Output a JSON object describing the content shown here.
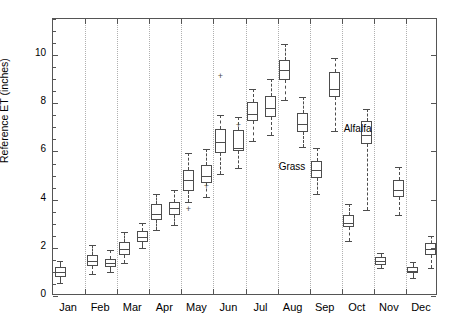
{
  "chart_data": {
    "type": "box",
    "title": "",
    "xlabel": "",
    "ylabel": "Reference ET (inches)",
    "ylim": [
      0,
      11.5
    ],
    "yticks": [
      0,
      2,
      4,
      6,
      8,
      10
    ],
    "ytick_labels": [
      "0",
      "2",
      "4",
      "6",
      "8",
      "10"
    ],
    "grid": "vertical-dotted",
    "categories": [
      "Jan",
      "Feb",
      "Mar",
      "Apr",
      "May",
      "Jun",
      "Jul",
      "Aug",
      "Sep",
      "Oct",
      "Nov",
      "Dec"
    ],
    "annotations": [
      {
        "text": "Alfalfa",
        "x_month": "Sep",
        "y": 6.9
      },
      {
        "text": "Grass",
        "x_month": "Sep",
        "y": 5.3
      }
    ],
    "series": [
      {
        "name": "Grass",
        "boxes": [
          {
            "category": "Jan",
            "whisker_low": 0.55,
            "q1": 0.8,
            "median": 1.0,
            "q3": 1.2,
            "whisker_high": 1.45,
            "outliers": []
          },
          {
            "category": "Feb",
            "whisker_low": 0.9,
            "q1": 1.25,
            "median": 1.45,
            "q3": 1.7,
            "whisker_high": 2.1,
            "outliers": []
          },
          {
            "category": "Mar",
            "whisker_low": 1.35,
            "q1": 1.7,
            "median": 1.95,
            "q3": 2.25,
            "whisker_high": 2.65,
            "outliers": []
          },
          {
            "category": "Apr",
            "whisker_low": 2.75,
            "q1": 3.15,
            "median": 3.4,
            "q3": 3.8,
            "whisker_high": 4.25,
            "outliers": []
          },
          {
            "category": "May",
            "whisker_low": 3.9,
            "q1": 4.35,
            "median": 4.8,
            "q3": 5.25,
            "whisker_high": 5.95,
            "outliers": [
              3.6
            ]
          },
          {
            "category": "Jun",
            "whisker_low": 5.05,
            "q1": 5.95,
            "median": 6.4,
            "q3": 6.95,
            "whisker_high": 7.5,
            "outliers": [
              9.15
            ]
          },
          {
            "category": "Jul",
            "whisker_low": 6.45,
            "q1": 7.25,
            "median": 7.55,
            "q3": 8.05,
            "whisker_high": 8.6,
            "outliers": []
          },
          {
            "category": "Aug",
            "whisker_low": 8.15,
            "q1": 8.95,
            "median": 9.4,
            "q3": 9.8,
            "whisker_high": 10.45,
            "outliers": []
          },
          {
            "category": "Sep",
            "whisker_low": 4.25,
            "q1": 4.9,
            "median": 5.25,
            "q3": 5.6,
            "whisker_high": 6.15,
            "outliers": []
          },
          {
            "category": "Oct",
            "whisker_low": 2.3,
            "q1": 2.85,
            "median": 3.05,
            "q3": 3.35,
            "whisker_high": 3.8,
            "outliers": []
          },
          {
            "category": "Nov",
            "whisker_low": 1.15,
            "q1": 1.3,
            "median": 1.45,
            "q3": 1.6,
            "whisker_high": 1.8,
            "outliers": []
          },
          {
            "category": "Dec",
            "whisker_low": 0.75,
            "q1": 0.95,
            "median": 1.05,
            "q3": 1.2,
            "whisker_high": 1.4,
            "outliers": []
          }
        ]
      },
      {
        "name": "Alfalfa",
        "boxes": [
          {
            "category": "Jan",
            "whisker_low": null,
            "q1": null,
            "median": null,
            "q3": null,
            "whisker_high": null,
            "outliers": []
          },
          {
            "category": "Feb",
            "whisker_low": 1.0,
            "q1": 1.2,
            "median": 1.35,
            "q3": 1.55,
            "whisker_high": 1.9,
            "outliers": []
          },
          {
            "category": "Mar",
            "whisker_low": 2.0,
            "q1": 2.25,
            "median": 2.45,
            "q3": 2.7,
            "whisker_high": 3.05,
            "outliers": []
          },
          {
            "category": "Apr",
            "whisker_low": 2.95,
            "q1": 3.35,
            "median": 3.65,
            "q3": 3.9,
            "whisker_high": 4.4,
            "outliers": []
          },
          {
            "category": "May",
            "whisker_low": 4.1,
            "q1": 4.7,
            "median": 5.0,
            "q3": 5.45,
            "whisker_high": 6.1,
            "outliers": [
              4.55
            ]
          },
          {
            "category": "Jun",
            "whisker_low": 5.3,
            "q1": 6.0,
            "median": 6.15,
            "q3": 6.9,
            "whisker_high": 7.45,
            "outliers": [
              7.1
            ]
          },
          {
            "category": "Jul",
            "whisker_low": 6.7,
            "q1": 7.45,
            "median": 7.8,
            "q3": 8.3,
            "whisker_high": 9.0,
            "outliers": []
          },
          {
            "category": "Aug",
            "whisker_low": 6.2,
            "q1": 6.8,
            "median": 7.15,
            "q3": 7.6,
            "whisker_high": 8.25,
            "outliers": []
          },
          {
            "category": "Sep",
            "whisker_low": 6.85,
            "q1": 8.25,
            "median": 8.6,
            "q3": 9.3,
            "whisker_high": 9.9,
            "outliers": []
          },
          {
            "category": "Oct",
            "whisker_low": 3.55,
            "q1": 6.3,
            "median": 6.7,
            "q3": 7.25,
            "whisker_high": 7.75,
            "outliers": []
          },
          {
            "category": "Nov",
            "whisker_low": 3.35,
            "q1": 4.1,
            "median": 4.4,
            "q3": 4.8,
            "whisker_high": 5.35,
            "outliers": []
          },
          {
            "category": "Dec",
            "whisker_low": 1.15,
            "q1": 1.7,
            "median": 1.95,
            "q3": 2.2,
            "whisker_high": 2.5,
            "outliers": []
          }
        ]
      }
    ]
  }
}
